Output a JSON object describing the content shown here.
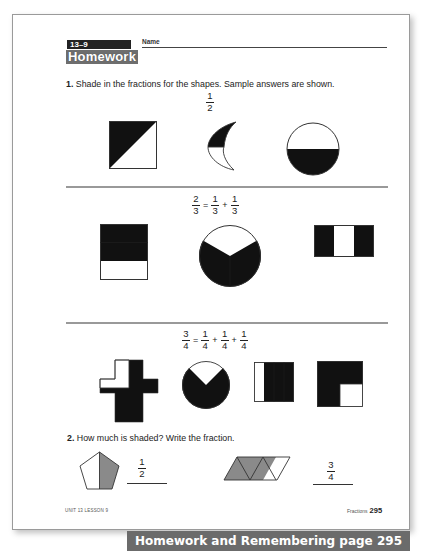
{
  "header": {
    "lesson_number": "13–9",
    "name_label": "Name",
    "title": "Homework"
  },
  "question1": {
    "number": "1.",
    "text": "Shade in the fractions for the shapes. Sample answers are shown.",
    "sections": [
      {
        "fraction": {
          "numerator": "1",
          "denominator": "2"
        },
        "shapes": [
          "square-diagonal-half",
          "crescent-half",
          "circle-bottom-half"
        ]
      },
      {
        "equation": {
          "lhs": {
            "numerator": "2",
            "denominator": "3"
          },
          "equals": "=",
          "terms": [
            {
              "numerator": "1",
              "denominator": "3"
            },
            {
              "numerator": "1",
              "denominator": "3"
            }
          ],
          "plus": "+"
        },
        "shapes": [
          "rectangle-thirds-top-two",
          "circle-thirds-two",
          "rectangle-thirds-outer-two"
        ]
      },
      {
        "equation": {
          "lhs": {
            "numerator": "3",
            "denominator": "4"
          },
          "equals": "=",
          "terms": [
            {
              "numerator": "1",
              "denominator": "4"
            },
            {
              "numerator": "1",
              "denominator": "4"
            },
            {
              "numerator": "1",
              "denominator": "4"
            }
          ],
          "plus": "+"
        },
        "shapes": [
          "cross-quarters-three",
          "circle-quarters-three",
          "rectangle-quarters-right-three",
          "square-quarters-three"
        ]
      }
    ]
  },
  "question2": {
    "number": "2.",
    "text": "How much is shaded? Write the fraction.",
    "answers": [
      {
        "shape": "pentagon-half-shaded",
        "numerator": "1",
        "denominator": "2"
      },
      {
        "shape": "parallelogram-triangles-three-shaded",
        "numerator": "3",
        "denominator": "4"
      }
    ]
  },
  "footer": {
    "left": "UNIT 13 LESSON 9",
    "right_label": "Fractions",
    "page_number": "295"
  },
  "banner": {
    "text": "Homework and Remembering page 295"
  },
  "colors": {
    "shade_dark": "#111111",
    "shade_gray": "#8a8a8a",
    "banner_bg": "#6b6b6b",
    "divider": "#999999"
  }
}
